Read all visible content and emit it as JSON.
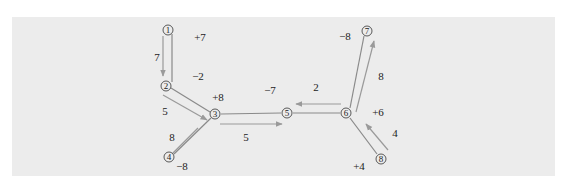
{
  "diagram": {
    "colors": {
      "background": "#ffffff",
      "panel": "#ececec",
      "edge": "#777777",
      "arrow": "#9a9a9a",
      "text": "#222222"
    },
    "nodes": [
      {
        "id": "1",
        "label": "①",
        "x": 168,
        "y": 30
      },
      {
        "id": "2",
        "label": "②",
        "x": 166,
        "y": 86
      },
      {
        "id": "3",
        "label": "③",
        "x": 215,
        "y": 114
      },
      {
        "id": "4",
        "label": "④",
        "x": 169,
        "y": 157
      },
      {
        "id": "5",
        "label": "⑤",
        "x": 287,
        "y": 113
      },
      {
        "id": "6",
        "label": "⑥",
        "x": 346,
        "y": 113
      },
      {
        "id": "7",
        "label": "⑦",
        "x": 367,
        "y": 31
      },
      {
        "id": "8",
        "label": "⑧",
        "x": 381,
        "y": 159
      }
    ],
    "labels": [
      {
        "text": "+7",
        "x": 200,
        "y": 37
      },
      {
        "text": "7",
        "x": 157,
        "y": 57
      },
      {
        "text": "−2",
        "x": 198,
        "y": 76
      },
      {
        "text": "+8",
        "x": 218,
        "y": 97
      },
      {
        "text": "5",
        "x": 165,
        "y": 111
      },
      {
        "text": "8",
        "x": 172,
        "y": 137
      },
      {
        "text": "−8",
        "x": 182,
        "y": 166
      },
      {
        "text": "5",
        "x": 246,
        "y": 137
      },
      {
        "text": "−7",
        "x": 270,
        "y": 90
      },
      {
        "text": "2",
        "x": 316,
        "y": 87
      },
      {
        "text": "−8",
        "x": 345,
        "y": 36
      },
      {
        "text": "8",
        "x": 381,
        "y": 76
      },
      {
        "text": "+6",
        "x": 378,
        "y": 112
      },
      {
        "text": "4",
        "x": 395,
        "y": 133
      },
      {
        "text": "+4",
        "x": 359,
        "y": 166
      }
    ]
  }
}
